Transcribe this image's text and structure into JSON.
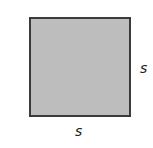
{
  "diagram": {
    "shape": "square",
    "fill_color": "#bdbdbd",
    "border_color": "#3a3a3a",
    "labels": {
      "right_side": "s",
      "bottom_side": "s"
    }
  }
}
